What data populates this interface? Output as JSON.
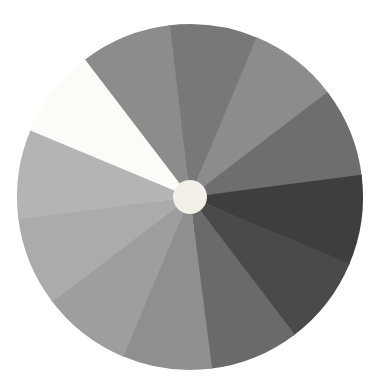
{
  "image": {
    "title": "Grayscale sector wheel",
    "width": 379,
    "height": 384,
    "background_color": "#ffffff"
  },
  "chart_data": {
    "type": "pie",
    "subtitle": "",
    "xlabel": "",
    "ylabel": "",
    "legend_position": "none",
    "grid": false,
    "center_x": 190,
    "center_y": 197,
    "radius": 173,
    "hub": {
      "label": "center-hub",
      "radius": 17,
      "color": "#f2f0e9"
    },
    "start_angle_deg": -97,
    "equal_slices": true,
    "slice_count": 12,
    "categories": [
      "slice-1",
      "slice-2",
      "slice-3",
      "slice-4",
      "slice-5",
      "slice-6",
      "slice-7",
      "slice-8",
      "slice-9",
      "slice-10",
      "slice-11",
      "slice-12"
    ],
    "values": [
      8.333,
      8.333,
      8.333,
      8.333,
      8.333,
      8.333,
      8.333,
      8.333,
      8.333,
      8.333,
      8.333,
      8.333
    ],
    "colors": [
      "#787878",
      "#8c8c8c",
      "#6e6e6e",
      "#5e5e5e",
      "#3e3e3e",
      "#4a4a4a",
      "#6a6a6a",
      "#8f8f8f",
      "#9e9e9e",
      "#ababab",
      "#b4b4b4",
      "#fbfbf8"
    ],
    "slices": [
      {
        "name": "slice-1",
        "label": "top",
        "start_deg": -97,
        "end_deg": -67,
        "color": "#787878",
        "percent": 8.333
      },
      {
        "name": "slice-2",
        "label": "upper-right-1",
        "start_deg": -67,
        "end_deg": -37,
        "color": "#8c8c8c",
        "percent": 8.333
      },
      {
        "name": "slice-3",
        "label": "upper-right-2",
        "start_deg": -37,
        "end_deg": -7,
        "color": "#6e6e6e",
        "percent": 8.333
      },
      {
        "name": "slice-4",
        "label": "right-upper",
        "start_deg": -7,
        "end_deg": 23,
        "color": "#3e3e3e",
        "percent": 8.333
      },
      {
        "name": "slice-5",
        "label": "right-lower",
        "start_deg": 23,
        "end_deg": 53,
        "color": "#4a4a4a",
        "percent": 8.333
      },
      {
        "name": "slice-6",
        "label": "lower-right-1",
        "start_deg": 53,
        "end_deg": 83,
        "color": "#6a6a6a",
        "percent": 8.333
      },
      {
        "name": "slice-7",
        "label": "bottom-right",
        "start_deg": 83,
        "end_deg": 113,
        "color": "#8f8f8f",
        "percent": 8.333
      },
      {
        "name": "slice-8",
        "label": "bottom-left",
        "start_deg": 113,
        "end_deg": 143,
        "color": "#9e9e9e",
        "percent": 8.333
      },
      {
        "name": "slice-9",
        "label": "lower-left-1",
        "start_deg": 143,
        "end_deg": 173,
        "color": "#ababab",
        "percent": 8.333
      },
      {
        "name": "slice-10",
        "label": "lower-left-2",
        "start_deg": 173,
        "end_deg": 203,
        "color": "#b4b4b4",
        "percent": 8.333
      },
      {
        "name": "slice-11",
        "label": "left-white",
        "start_deg": 203,
        "end_deg": 233,
        "color": "#fbfbf8",
        "percent": 8.333
      },
      {
        "name": "slice-12",
        "label": "upper-left",
        "start_deg": 233,
        "end_deg": 263,
        "color": "#8c8c8c",
        "percent": 8.333
      }
    ]
  }
}
